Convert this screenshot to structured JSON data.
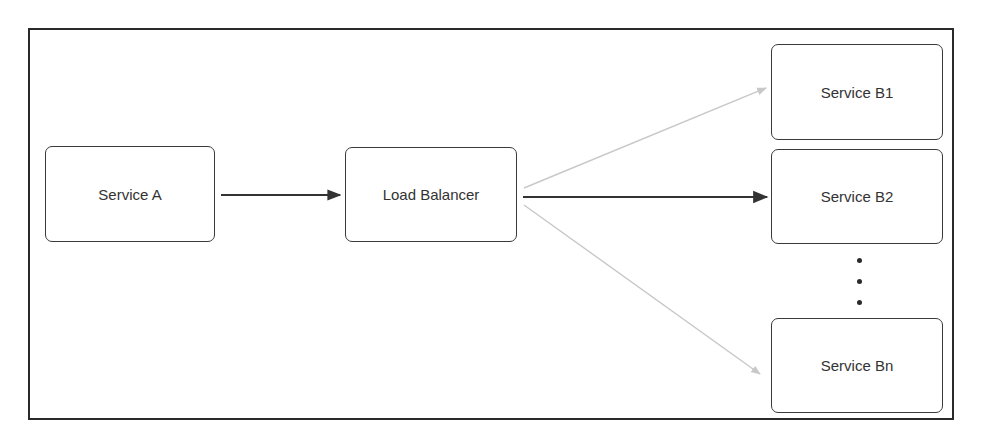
{
  "diagram": {
    "nodes": {
      "service_a": "Service A",
      "load_balancer": "Load Balancer",
      "service_b1": "Service B1",
      "service_b2": "Service B2",
      "service_bn": "Service Bn"
    },
    "edges": [
      {
        "from": "service_a",
        "to": "load_balancer",
        "style": "solid-dark"
      },
      {
        "from": "load_balancer",
        "to": "service_b1",
        "style": "faint"
      },
      {
        "from": "load_balancer",
        "to": "service_b2",
        "style": "solid-dark"
      },
      {
        "from": "load_balancer",
        "to": "service_bn",
        "style": "faint"
      }
    ],
    "ellipsis": "vertical dots between Service B2 and Service Bn",
    "colors": {
      "border": "#3a3a3a",
      "arrow_dark": "#333333",
      "arrow_faint": "#c8c8c8",
      "text": "#333333"
    }
  }
}
